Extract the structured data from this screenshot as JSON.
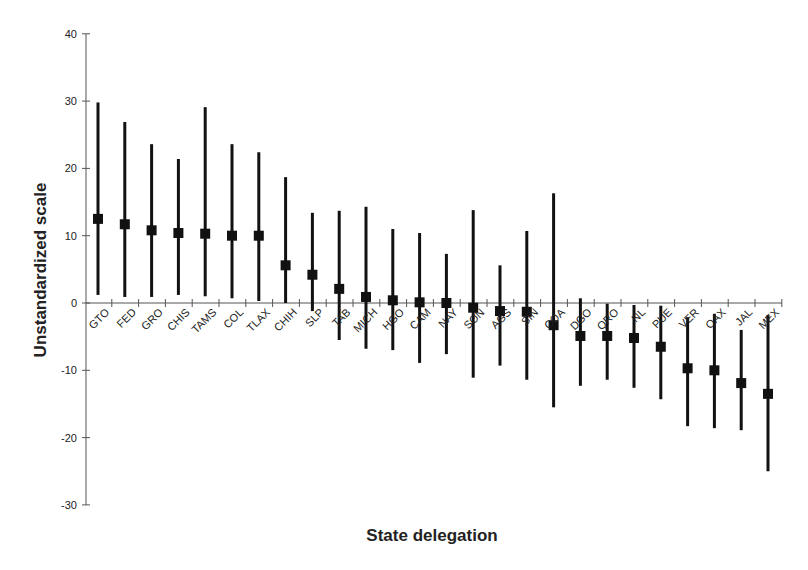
{
  "chart_data": {
    "type": "errorbar",
    "title": "",
    "xlabel": "State delegation",
    "ylabel": "Unstandardized scale",
    "ylim": [
      -30,
      40
    ],
    "yticks": [
      40,
      30,
      20,
      10,
      0,
      -10,
      -20,
      -30
    ],
    "grid": false,
    "legend": null,
    "categories": [
      "GTO",
      "FED",
      "GRO",
      "CHIS",
      "TAMS",
      "COL",
      "TLAX",
      "CHIH",
      "SLP",
      "TAB",
      "MICH",
      "HGO",
      "CAM",
      "NAY",
      "SON",
      "AGS",
      "SIN",
      "COA",
      "DGO",
      "QRO",
      "NL",
      "PUE",
      "VER",
      "OAX",
      "JAL",
      "MEX"
    ],
    "series": [
      {
        "name": "estimate",
        "values": [
          12.5,
          11.7,
          10.8,
          10.4,
          10.3,
          10.0,
          10.0,
          5.6,
          4.2,
          2.1,
          0.9,
          0.4,
          0.1,
          0.0,
          -0.7,
          -1.2,
          -1.3,
          -3.3,
          -4.9,
          -4.9,
          -5.2,
          -6.5,
          -9.7,
          -10.0,
          -11.9,
          -13.5
        ]
      },
      {
        "name": "upper",
        "values": [
          29.8,
          26.9,
          23.6,
          21.4,
          29.1,
          23.6,
          22.4,
          18.7,
          13.4,
          13.7,
          14.3,
          11.0,
          10.4,
          7.3,
          13.8,
          5.6,
          10.7,
          16.3,
          0.7,
          -0.1,
          -0.3,
          -0.4,
          -2.1,
          -1.6,
          -4.0,
          -1.8
        ]
      },
      {
        "name": "lower",
        "values": [
          1.2,
          0.9,
          0.9,
          1.2,
          1.0,
          0.7,
          0.3,
          0.0,
          -1.2,
          -5.5,
          -6.8,
          -7.0,
          -8.9,
          -7.6,
          -11.1,
          -9.3,
          -11.4,
          -15.5,
          -12.3,
          -11.4,
          -12.6,
          -14.3,
          -18.3,
          -18.6,
          -18.9,
          -25.0
        ]
      }
    ]
  }
}
